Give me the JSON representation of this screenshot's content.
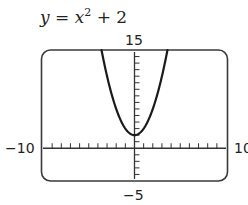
{
  "chart_data": {
    "type": "line",
    "title_parts": {
      "lhs": "y",
      "eq": " = ",
      "var": "x",
      "exp": "2",
      "rest": " + 2"
    },
    "function": "y = x^2 + 2",
    "xlim": [
      -10,
      10
    ],
    "ylim": [
      -5,
      15
    ],
    "xscl": 1,
    "yscl": 1,
    "xlabel": "",
    "ylabel": "",
    "tick_labels": {
      "ymax": "15",
      "ymin": "−5",
      "xmin": "−10",
      "xmax": "10"
    },
    "grid": false,
    "series": [
      {
        "name": "y = x^2 + 2",
        "x": [
          -3.6,
          -3,
          -2,
          -1,
          0,
          1,
          2,
          3,
          3.6
        ],
        "values": [
          14.96,
          11,
          6,
          3,
          2,
          3,
          6,
          11,
          14.96
        ]
      }
    ],
    "vertex": [
      0,
      2
    ]
  },
  "colors": {
    "curve": "#1a1a1a",
    "axis": "#333333",
    "frame": "#3a3a3a"
  }
}
